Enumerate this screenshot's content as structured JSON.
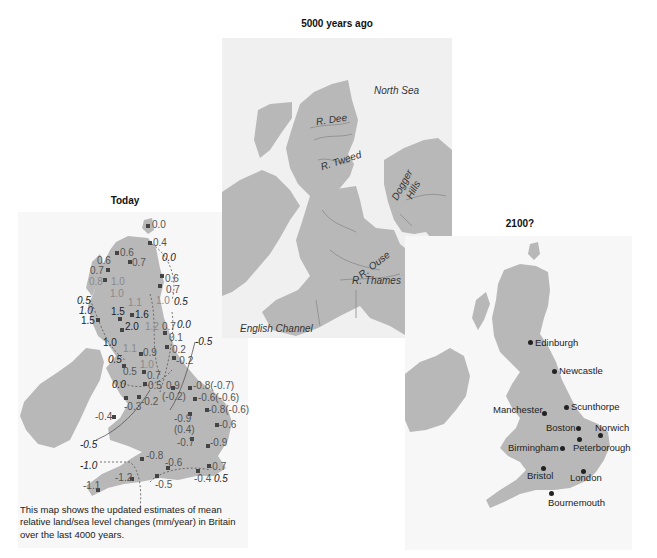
{
  "titles": {
    "today": "Today",
    "past": "5000 years ago",
    "future": "2100?"
  },
  "colors": {
    "land": "#b8b8b8",
    "sea_middle": "#f0f0f0",
    "panel_bg": "#f7f7f7",
    "label_dark": "#222222",
    "label_gray": "#6b6b6b"
  },
  "today_map": {
    "caption": "This map shows the updated estimates of mean relative land/sea level changes (mm/year) in Britain over the last 4000 years.",
    "site_values": [
      {
        "text": "0.0",
        "x": 152,
        "y": 225
      },
      {
        "text": "0.4",
        "x": 152,
        "y": 241
      },
      {
        "text": "0.6",
        "x": 120,
        "y": 250
      },
      {
        "text": "0.6",
        "x": 98,
        "y": 258
      },
      {
        "text": "0.7",
        "x": 131,
        "y": 258
      },
      {
        "text": "0.7",
        "x": 91,
        "y": 266
      },
      {
        "text": "0.8",
        "x": 90,
        "y": 276
      },
      {
        "text": "1.0",
        "x": 112,
        "y": 276
      },
      {
        "text": "1.0",
        "x": 112,
        "y": 290
      },
      {
        "text": "1.1",
        "x": 130,
        "y": 298
      },
      {
        "text": "0.6",
        "x": 165,
        "y": 272
      },
      {
        "text": "0.7",
        "x": 165,
        "y": 283
      },
      {
        "text": "1.0",
        "x": 157,
        "y": 296
      },
      {
        "text": "1.5",
        "x": 110,
        "y": 308
      },
      {
        "text": "1.6",
        "x": 135,
        "y": 310
      },
      {
        "text": "2.0",
        "x": 124,
        "y": 322
      },
      {
        "text": "1.2",
        "x": 146,
        "y": 323
      },
      {
        "text": "0.7",
        "x": 162,
        "y": 323
      },
      {
        "text": "0.1",
        "x": 169,
        "y": 334
      },
      {
        "text": "1.5",
        "x": 81,
        "y": 317
      },
      {
        "text": "1.0",
        "x": 103,
        "y": 338
      },
      {
        "text": "1.1",
        "x": 123,
        "y": 344
      },
      {
        "text": "0.9",
        "x": 140,
        "y": 349
      },
      {
        "text": "0.2",
        "x": 172,
        "y": 345
      },
      {
        "text": "1.0",
        "x": 140,
        "y": 361
      },
      {
        "text": "-0.2",
        "x": 174,
        "y": 357
      },
      {
        "text": "0.5",
        "x": 121,
        "y": 368
      },
      {
        "text": "0.7",
        "x": 145,
        "y": 373
      },
      {
        "text": "0.5",
        "x": 148,
        "y": 385
      },
      {
        "text": "0.9",
        "x": 168,
        "y": 385
      },
      {
        "text": "(-0.2)",
        "x": 165,
        "y": 395
      },
      {
        "text": "-0.8(-0.7)",
        "x": 195,
        "y": 385
      },
      {
        "text": "-0.6(-0.6)",
        "x": 200,
        "y": 397
      },
      {
        "text": "-0.3",
        "x": 132,
        "y": 401
      },
      {
        "text": "-0.2",
        "x": 143,
        "y": 398
      },
      {
        "text": "-0.8(-0.6)",
        "x": 210,
        "y": 409
      },
      {
        "text": "-0.4",
        "x": 113,
        "y": 412
      },
      {
        "text": "-0.9",
        "x": 175,
        "y": 416
      },
      {
        "text": "(0.4)",
        "x": 175,
        "y": 427
      },
      {
        "text": "-0.6",
        "x": 221,
        "y": 423
      },
      {
        "text": "-0.7",
        "x": 178,
        "y": 441
      },
      {
        "text": "-0.9",
        "x": 211,
        "y": 441
      },
      {
        "text": "-0.8",
        "x": 146,
        "y": 453
      },
      {
        "text": "-0.6",
        "x": 170,
        "y": 460
      },
      {
        "text": "-0.7",
        "x": 211,
        "y": 463
      },
      {
        "text": "-1.2",
        "x": 118,
        "y": 474
      },
      {
        "text": "-0.4",
        "x": 196,
        "y": 475
      },
      {
        "text": "-0.5",
        "x": 157,
        "y": 481
      },
      {
        "text": "-1.1",
        "x": 87,
        "y": 484
      }
    ],
    "contour_values": [
      {
        "text": "0.0",
        "x": 162,
        "y": 254
      },
      {
        "text": "0.5",
        "x": 173,
        "y": 298
      },
      {
        "text": "0.0",
        "x": 177,
        "y": 320
      },
      {
        "text": "-0.5",
        "x": 195,
        "y": 337
      },
      {
        "text": "0.5",
        "x": 77,
        "y": 296
      },
      {
        "text": "1.0",
        "x": 79,
        "y": 307
      },
      {
        "text": "0.5",
        "x": 108,
        "y": 358
      },
      {
        "text": "0.0",
        "x": 112,
        "y": 381
      },
      {
        "text": "-0.5",
        "x": 80,
        "y": 441
      },
      {
        "text": "-1.0",
        "x": 80,
        "y": 463
      },
      {
        "text": "0.5",
        "x": 214,
        "y": 475
      }
    ]
  },
  "past_map": {
    "labels": [
      {
        "text": "North Sea",
        "x": 374,
        "y": 86,
        "rot": 0
      },
      {
        "text": "R. Dee",
        "x": 318,
        "y": 117,
        "rot": -8
      },
      {
        "text": "R. Tweed",
        "x": 321,
        "y": 157,
        "rot": -18
      },
      {
        "text": "Dogger",
        "x": 392,
        "y": 178,
        "rot": -62
      },
      {
        "text": "Hills",
        "x": 408,
        "y": 184,
        "rot": -62
      },
      {
        "text": "R. Ouse",
        "x": 358,
        "y": 262,
        "rot": -38
      },
      {
        "text": "R. Thames",
        "x": 352,
        "y": 277,
        "rot": 0
      },
      {
        "text": "English Channel",
        "x": 240,
        "y": 326,
        "rot": 0
      }
    ]
  },
  "future_map": {
    "cities": [
      {
        "name": "Edinburgh",
        "dot_x": 530,
        "dot_y": 342,
        "label_x": 535,
        "label_y": 340
      },
      {
        "name": "Newcastle",
        "dot_x": 554,
        "dot_y": 371,
        "label_x": 560,
        "label_y": 368
      },
      {
        "name": "Scunthorpe",
        "dot_x": 566,
        "dot_y": 407,
        "label_x": 571,
        "label_y": 403
      },
      {
        "name": "Manchester",
        "dot_x": 544,
        "dot_y": 413,
        "label_x": 493,
        "label_y": 406
      },
      {
        "name": "Boston",
        "dot_x": 578,
        "dot_y": 428,
        "label_x": 546,
        "label_y": 424
      },
      {
        "name": "Norwich",
        "dot_x": 600,
        "dot_y": 435,
        "label_x": 594,
        "label_y": 424
      },
      {
        "name": "Peterborough",
        "dot_x": 579,
        "dot_y": 439,
        "label_x": 573,
        "label_y": 444
      },
      {
        "name": "Birmingham",
        "dot_x": 562,
        "dot_y": 448,
        "label_x": 508,
        "label_y": 444
      },
      {
        "name": "Bristol",
        "dot_x": 543,
        "dot_y": 468,
        "label_x": 527,
        "label_y": 471
      },
      {
        "name": "London",
        "dot_x": 583,
        "dot_y": 471,
        "label_x": 569,
        "label_y": 473
      },
      {
        "name": "Bournemouth",
        "dot_x": 551,
        "dot_y": 493,
        "label_x": 548,
        "label_y": 498
      }
    ]
  }
}
